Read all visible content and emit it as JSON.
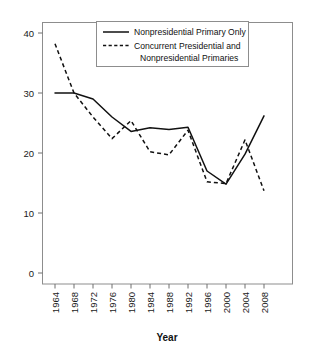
{
  "chart_data": {
    "type": "line",
    "title": "",
    "xlabel": "Year",
    "ylabel": "",
    "x": [
      1964,
      1968,
      1972,
      1976,
      1980,
      1984,
      1988,
      1992,
      1996,
      2000,
      2004,
      2008
    ],
    "xticks": [
      "1964",
      "1968",
      "1972",
      "1976",
      "1980",
      "1984",
      "1988",
      "1992",
      "1996",
      "2000",
      "2004",
      "2008"
    ],
    "yticks": [
      "0",
      "10",
      "20",
      "30",
      "40"
    ],
    "ytick_values": [
      0,
      10,
      20,
      30,
      40
    ],
    "xlim": [
      1964,
      2008
    ],
    "ylim": [
      0,
      42
    ],
    "grid": false,
    "legend_position": "top-center",
    "series": [
      {
        "name": "Nonpresidential Primary Only",
        "style": "solid",
        "color": "#111111",
        "x": [
          1964,
          1968,
          1972,
          1976,
          1980,
          1984,
          1988,
          1992,
          1996,
          2000,
          2004,
          2008
        ],
        "values": [
          30.0,
          30.0,
          29.0,
          26.0,
          23.6,
          24.2,
          23.9,
          24.3,
          17.0,
          14.8,
          19.8,
          26.2
        ]
      },
      {
        "name": "Concurrent Presidential and Nonpresidential Primaries",
        "style": "dashed",
        "color": "#111111",
        "x": [
          1964,
          1968,
          1972,
          1976,
          1980,
          1984,
          1988,
          1992,
          1996,
          2000,
          2004,
          2008
        ],
        "values": [
          38.2,
          30.0,
          26.0,
          22.4,
          25.4,
          20.2,
          19.7,
          23.8,
          15.2,
          14.9,
          22.2,
          13.7
        ]
      }
    ]
  },
  "legend": {
    "entries": [
      {
        "label": "Nonpresidential Primary Only",
        "style": "solid"
      },
      {
        "label": "Concurrent Presidential and",
        "style": "dashed"
      },
      {
        "label": "Nonpresidential Primaries",
        "style": "none"
      }
    ]
  },
  "axes": {
    "x_title": "Year"
  }
}
